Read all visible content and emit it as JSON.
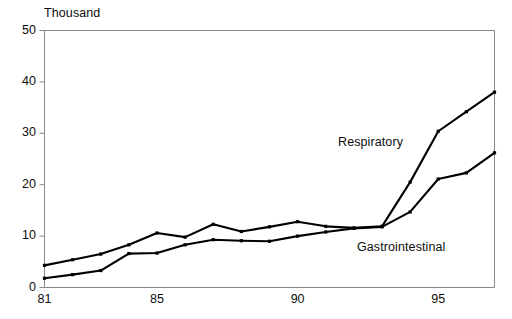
{
  "chart_data": {
    "type": "line",
    "title": "",
    "subtitle": "",
    "xlabel": "",
    "ylabel": "Thousand",
    "unit_label": "Thousand",
    "grid": false,
    "legend_position": "inline-annotation",
    "xlim": [
      81,
      97
    ],
    "ylim": [
      0,
      50
    ],
    "yticks": [
      0,
      10,
      20,
      30,
      40,
      50
    ],
    "ytick_labels": [
      "0",
      "10",
      "20",
      "30",
      "40",
      "50"
    ],
    "xticks": [
      81,
      85,
      90,
      95
    ],
    "xtick_labels": [
      "81",
      "85",
      "90",
      "95"
    ],
    "x": [
      81,
      82,
      83,
      84,
      85,
      86,
      87,
      88,
      89,
      90,
      91,
      92,
      93,
      94,
      95,
      96,
      97
    ],
    "series": [
      {
        "name": "Respiratory",
        "color": "#000000",
        "values": [
          4.3,
          5.4,
          6.5,
          8.3,
          10.6,
          9.8,
          12.3,
          10.9,
          11.8,
          12.8,
          11.9,
          11.6,
          11.9,
          20.5,
          30.4,
          34.2,
          38.0
        ]
      },
      {
        "name": "Gastrointestinal",
        "color": "#000000",
        "values": [
          1.8,
          2.5,
          3.3,
          6.6,
          6.7,
          8.3,
          9.3,
          9.1,
          9.0,
          10.0,
          10.8,
          11.5,
          11.8,
          14.7,
          21.1,
          22.3,
          26.2
        ]
      }
    ],
    "annotations": [
      {
        "text": "Respiratory",
        "x": 81.5,
        "y": 27.5,
        "px": 338,
        "py": 135
      },
      {
        "text": "Gastrointestinal",
        "x": 81.5,
        "y": 8.0,
        "px": 357,
        "py": 240
      }
    ]
  }
}
